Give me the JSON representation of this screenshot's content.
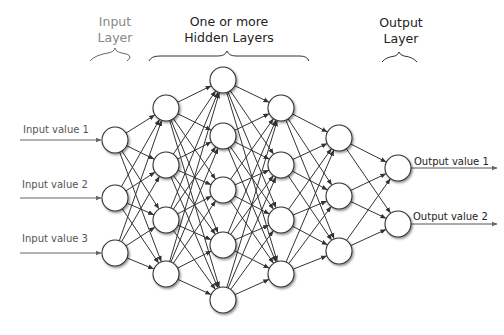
{
  "headers": {
    "input": {
      "line1": "Input",
      "line2": "Layer"
    },
    "hidden": {
      "line1": "One or more",
      "line2": "Hidden Layers"
    },
    "output": {
      "line1": "Output",
      "line2": "Layer"
    }
  },
  "inputs": [
    "Input value 1",
    "Input value 2",
    "Input value 3"
  ],
  "outputs": [
    "Output value 1",
    "Output value 2"
  ],
  "network": {
    "layers": [
      {
        "name": "input",
        "x": 115,
        "ys": [
          140,
          198,
          253
        ]
      },
      {
        "name": "hidden-1",
        "x": 166,
        "ys": [
          108,
          165,
          220,
          274
        ]
      },
      {
        "name": "hidden-2",
        "x": 223,
        "ys": [
          80,
          136,
          190,
          245,
          300
        ]
      },
      {
        "name": "hidden-3",
        "x": 281,
        "ys": [
          108,
          165,
          220,
          274
        ]
      },
      {
        "name": "hidden-4",
        "x": 339,
        "ys": [
          138,
          196,
          251
        ]
      },
      {
        "name": "output",
        "x": 398,
        "ys": [
          168,
          224
        ]
      }
    ],
    "node_radius": 13,
    "colors": {
      "stroke": "#333333",
      "fill": "#ffffff",
      "arrow": "#555555"
    }
  }
}
